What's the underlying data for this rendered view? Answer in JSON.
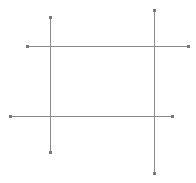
{
  "canvas": {
    "width": 196,
    "height": 183,
    "background": "#ffffff"
  },
  "style": {
    "line_color": "#8a8a8a",
    "marker_color": "#7a7a7a",
    "line_width": 1,
    "marker_size": 3
  },
  "lines": [
    {
      "id": "vertical-left",
      "orientation": "vertical",
      "x1": 50,
      "y1": 17,
      "x2": 50,
      "y2": 152
    },
    {
      "id": "vertical-right",
      "orientation": "vertical",
      "x1": 154,
      "y1": 10,
      "x2": 154,
      "y2": 173
    },
    {
      "id": "horizontal-top",
      "orientation": "horizontal",
      "x1": 27,
      "y1": 46,
      "x2": 188,
      "y2": 46
    },
    {
      "id": "horizontal-bottom",
      "orientation": "horizontal",
      "x1": 10,
      "y1": 116,
      "x2": 172,
      "y2": 116
    }
  ]
}
